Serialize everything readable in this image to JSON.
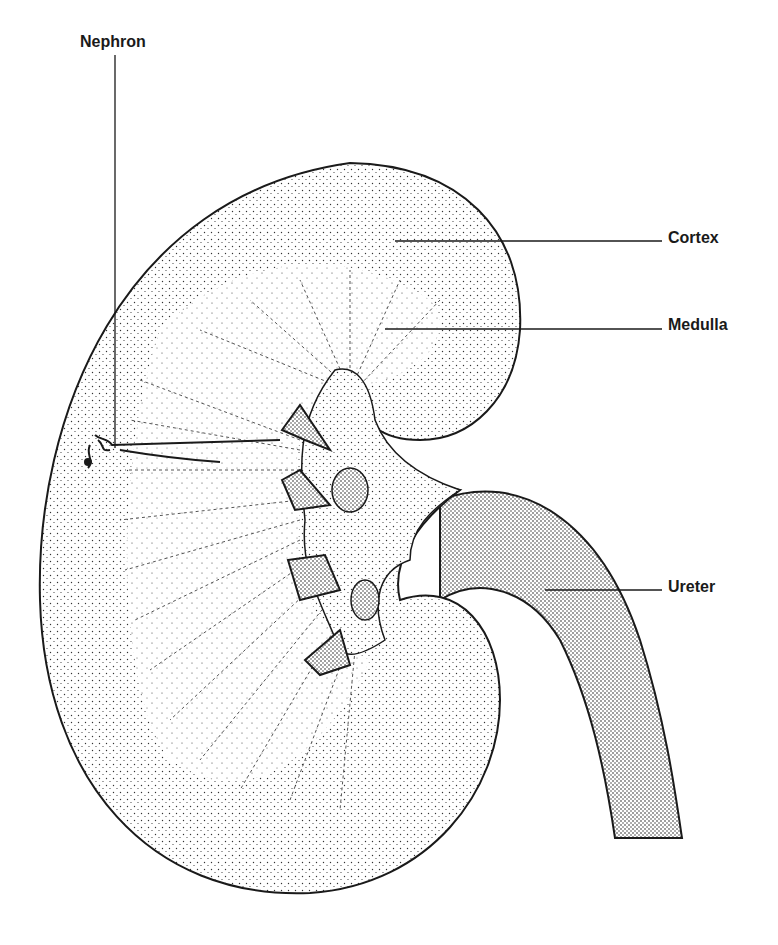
{
  "diagram": {
    "ink_color": "#1a1a1a",
    "background": "#ffffff",
    "labels": [
      {
        "id": "nephron",
        "text": "Nephron",
        "x": 80,
        "y": 33,
        "leader": {
          "x1": 115,
          "y1": 55,
          "x2": 115,
          "y2": 448
        }
      },
      {
        "id": "cortex",
        "text": "Cortex",
        "x": 668,
        "y": 229,
        "leader": {
          "x1": 395,
          "y1": 241,
          "x2": 662,
          "y2": 241
        }
      },
      {
        "id": "medulla",
        "text": "Medulla",
        "x": 668,
        "y": 316,
        "leader": {
          "x1": 385,
          "y1": 329,
          "x2": 662,
          "y2": 329
        }
      },
      {
        "id": "ureter",
        "text": "Ureter",
        "x": 668,
        "y": 578,
        "leader": {
          "x1": 545,
          "y1": 590,
          "x2": 662,
          "y2": 590
        }
      }
    ]
  }
}
